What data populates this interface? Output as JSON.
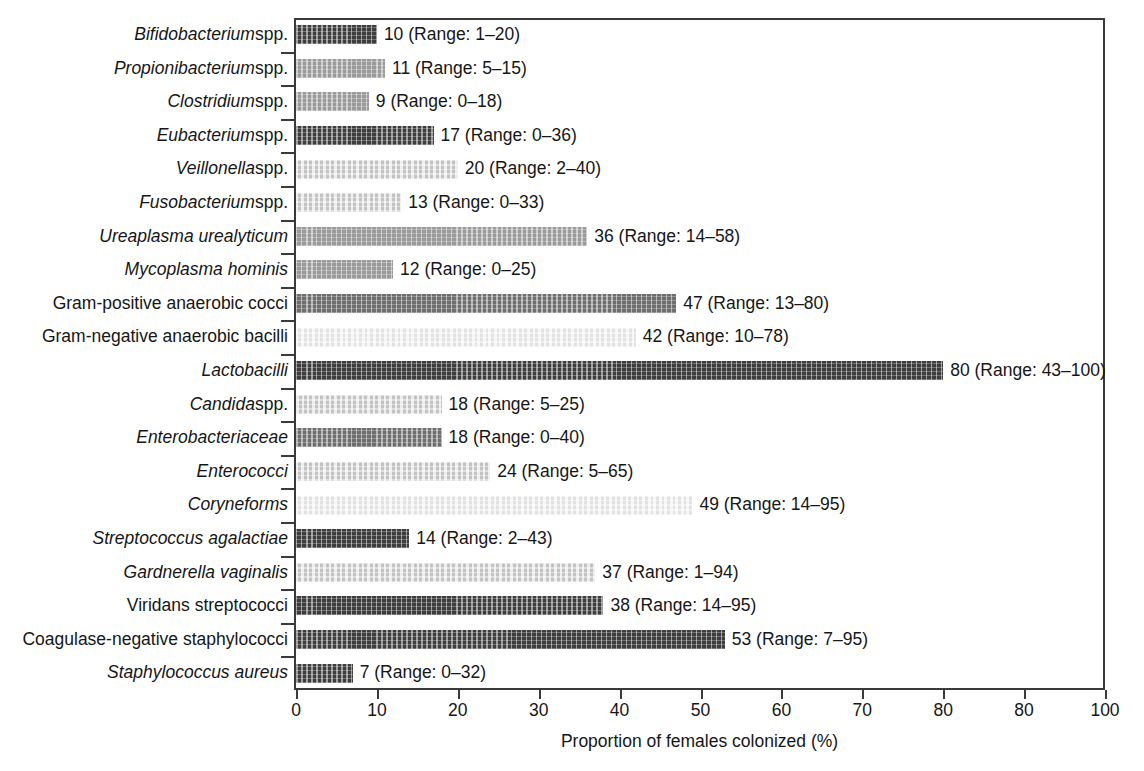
{
  "chart_data": {
    "type": "bar",
    "orientation": "horizontal",
    "title": "",
    "xlabel": "Proportion of females colonized (%)",
    "ylabel": "",
    "xlim": [
      0,
      100
    ],
    "xticks": [
      0,
      10,
      20,
      30,
      40,
      50,
      60,
      70,
      80,
      90,
      100
    ],
    "xtick_labels": [
      "0",
      "10",
      "20",
      "30",
      "40",
      "50",
      "60",
      "70",
      "80",
      "80",
      "100"
    ],
    "grid": false,
    "legend": null,
    "categories": [
      "Bifidobacterium spp.",
      "Propionibacterium spp.",
      "Clostridium spp.",
      "Eubacterium spp.",
      "Veillonella spp.",
      "Fusobacterium spp.",
      "Ureaplasma urealyticum",
      "Mycoplasma hominis",
      "Gram-positive anaerobic cocci",
      "Gram-negative anaerobic bacilli",
      "Lactobacilli",
      "Candida spp.",
      "Enterobacteriaceae",
      "Enterococci",
      "Coryneforms",
      "Streptococcus agalactiae",
      "Gardnerella vaginalis",
      "Viridans streptococci",
      "Coagulase-negative staphylococci",
      "Staphylococcus aureus"
    ],
    "values": [
      10,
      11,
      9,
      17,
      20,
      13,
      36,
      12,
      47,
      42,
      80,
      18,
      18,
      24,
      49,
      14,
      37,
      38,
      53,
      7
    ],
    "range_low": [
      1,
      5,
      0,
      0,
      2,
      0,
      14,
      0,
      13,
      10,
      43,
      5,
      0,
      5,
      14,
      2,
      1,
      14,
      7,
      0
    ],
    "range_high": [
      20,
      15,
      18,
      36,
      40,
      33,
      58,
      25,
      80,
      78,
      100,
      25,
      40,
      65,
      95,
      43,
      94,
      95,
      95,
      32
    ]
  },
  "axis": {
    "x_title": "Proportion of females colonized (%)",
    "ticks": [
      {
        "value": 0,
        "label": "0"
      },
      {
        "value": 10,
        "label": "10"
      },
      {
        "value": 20,
        "label": "20"
      },
      {
        "value": 30,
        "label": "30"
      },
      {
        "value": 40,
        "label": "40"
      },
      {
        "value": 50,
        "label": "50"
      },
      {
        "value": 60,
        "label": "60"
      },
      {
        "value": 70,
        "label": "70"
      },
      {
        "value": 80,
        "label": "80"
      },
      {
        "value": 90,
        "label": "80"
      },
      {
        "value": 100,
        "label": "100"
      }
    ]
  },
  "rows": [
    {
      "italic_part": "Bifidobacterium",
      "roman_part": " spp.",
      "value": 10,
      "value_text": "10 (Range: 1–20)",
      "tone": "dark"
    },
    {
      "italic_part": "Propionibacterium",
      "roman_part": " spp.",
      "value": 11,
      "value_text": "11 (Range: 5–15)",
      "tone": "mid"
    },
    {
      "italic_part": "Clostridium",
      "roman_part": " spp.",
      "value": 9,
      "value_text": "9 (Range: 0–18)",
      "tone": "mid"
    },
    {
      "italic_part": "Eubacterium",
      "roman_part": " spp.",
      "value": 17,
      "value_text": "17 (Range: 0–36)",
      "tone": "dark"
    },
    {
      "italic_part": "Veillonella",
      "roman_part": " spp.",
      "value": 20,
      "value_text": "20 (Range: 2–40)",
      "tone": "light"
    },
    {
      "italic_part": "Fusobacterium",
      "roman_part": " spp.",
      "value": 13,
      "value_text": "13 (Range: 0–33)",
      "tone": "light"
    },
    {
      "italic_part": "Ureaplasma urealyticum",
      "roman_part": "",
      "value": 36,
      "value_text": "36 (Range: 14–58)",
      "tone": "mid"
    },
    {
      "italic_part": "Mycoplasma hominis",
      "roman_part": "",
      "value": 12,
      "value_text": "12 (Range: 0–25)",
      "tone": "mid"
    },
    {
      "italic_part": "",
      "roman_part": "Gram-positive anaerobic cocci",
      "value": 47,
      "value_text": "47 (Range: 13–80)",
      "tone": "medium-dark"
    },
    {
      "italic_part": "",
      "roman_part": "Gram-negative anaerobic bacilli",
      "value": 42,
      "value_text": "42 (Range: 10–78)",
      "tone": "verylight"
    },
    {
      "italic_part": "Lactobacilli",
      "roman_part": "",
      "value": 80,
      "value_text": "80 (Range: 43–100)",
      "tone": "dark"
    },
    {
      "italic_part": "Candida",
      "roman_part": " spp.",
      "value": 18,
      "value_text": "18 (Range: 5–25)",
      "tone": "light"
    },
    {
      "italic_part": "Enterobacteriaceae",
      "roman_part": "",
      "value": 18,
      "value_text": "18 (Range: 0–40)",
      "tone": "medium-dark"
    },
    {
      "italic_part": "Enterococci",
      "roman_part": "",
      "value": 24,
      "value_text": "24 (Range: 5–65)",
      "tone": "light"
    },
    {
      "italic_part": "Coryneforms",
      "roman_part": "",
      "value": 49,
      "value_text": "49 (Range: 14–95)",
      "tone": "verylight"
    },
    {
      "italic_part": "Streptococcus agalactiae",
      "roman_part": "",
      "value": 14,
      "value_text": "14 (Range: 2–43)",
      "tone": "dark"
    },
    {
      "italic_part": "Gardnerella vaginalis",
      "roman_part": "",
      "value": 37,
      "value_text": "37 (Range: 1–94)",
      "tone": "light"
    },
    {
      "italic_part": "",
      "roman_part": "Viridans streptococci",
      "value": 38,
      "value_text": "38 (Range: 14–95)",
      "tone": "dark"
    },
    {
      "italic_part": "",
      "roman_part": "Coagulase-negative staphylococci",
      "value": 53,
      "value_text": "53 (Range: 7–95)",
      "tone": "dark"
    },
    {
      "italic_part": "Staphylococcus aureus",
      "roman_part": "",
      "value": 7,
      "value_text": "7 (Range: 0–32)",
      "tone": "dark"
    }
  ],
  "colors": {
    "dark": "#3d3d3d",
    "medium_dark": "#6e6e6e",
    "mid": "#9a9a9a",
    "light": "#c3c3c3",
    "verylight": "#e2e2e2",
    "axis": "#3a3a3a",
    "text": "#161616",
    "background": "#ffffff"
  }
}
